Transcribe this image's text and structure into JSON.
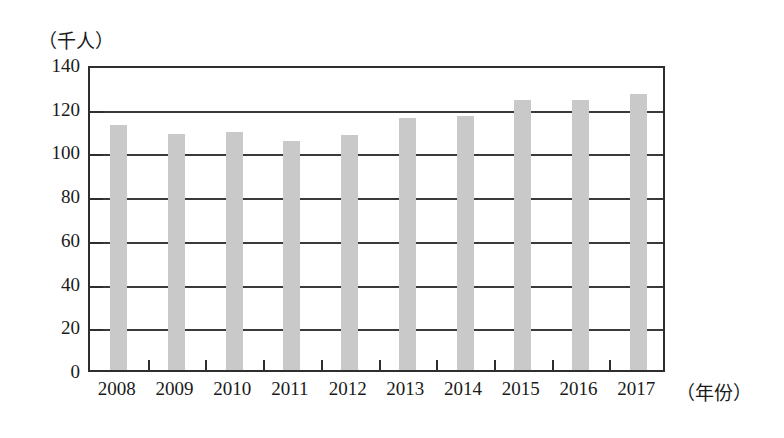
{
  "chart_data": {
    "type": "bar",
    "title": "",
    "subtitle": "",
    "xlabel": "（年份）",
    "ylabel": "（千人）",
    "categories": [
      "2008",
      "2009",
      "2010",
      "2011",
      "2012",
      "2013",
      "2014",
      "2015",
      "2016",
      "2017"
    ],
    "values": [
      112,
      108,
      109,
      105,
      107.5,
      115.5,
      116,
      123.5,
      123.5,
      126.5
    ],
    "series": [
      {
        "name": "人数",
        "values": [
          112,
          108,
          109,
          105,
          107.5,
          115.5,
          116,
          123.5,
          123.5,
          126.5
        ]
      }
    ],
    "ylim": [
      0,
      140
    ],
    "y_ticks": [
      "0",
      "20",
      "40",
      "60",
      "80",
      "100",
      "120",
      "140"
    ],
    "y_tick_values": [
      0,
      20,
      40,
      60,
      80,
      100,
      120,
      140
    ],
    "grid": true,
    "grid_axis": "y",
    "legend": false,
    "legend_position": "none",
    "bar_color": "#c9c9c9",
    "axis_color": "#2e2e2e",
    "background_color": "#ffffff"
  }
}
